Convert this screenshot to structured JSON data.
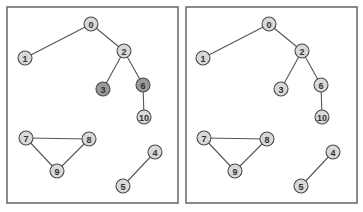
{
  "colors": {
    "background": "#ffffff",
    "panel_border": "#6e6e6e",
    "edge": "#555555",
    "node_fill_default": "#d9d9d9",
    "node_fill_highlight": "#9a9a9a",
    "node_stroke": "#4a4a4a",
    "label": "#333333"
  },
  "graph": {
    "node_radius": 7,
    "nodes": [
      {
        "id": "0",
        "label": "0",
        "x": 91,
        "y": 24
      },
      {
        "id": "1",
        "label": "1",
        "x": 25,
        "y": 58
      },
      {
        "id": "2",
        "label": "2",
        "x": 124,
        "y": 51
      },
      {
        "id": "3",
        "label": "3",
        "x": 103,
        "y": 89
      },
      {
        "id": "6",
        "label": "6",
        "x": 143,
        "y": 85
      },
      {
        "id": "10",
        "label": "10",
        "x": 144,
        "y": 117
      },
      {
        "id": "7",
        "label": "7",
        "x": 26,
        "y": 138
      },
      {
        "id": "8",
        "label": "8",
        "x": 89,
        "y": 139
      },
      {
        "id": "9",
        "label": "9",
        "x": 57,
        "y": 171
      },
      {
        "id": "4",
        "label": "4",
        "x": 155,
        "y": 152
      },
      {
        "id": "5",
        "label": "5",
        "x": 123,
        "y": 186
      }
    ],
    "edges": [
      [
        "0",
        "1"
      ],
      [
        "0",
        "2"
      ],
      [
        "2",
        "3"
      ],
      [
        "2",
        "6"
      ],
      [
        "6",
        "10"
      ],
      [
        "7",
        "8"
      ],
      [
        "7",
        "9"
      ],
      [
        "8",
        "9"
      ],
      [
        "4",
        "5"
      ]
    ]
  },
  "panels": [
    {
      "name": "left",
      "x": 7,
      "y": 7,
      "width": 171,
      "height": 196,
      "offset_x": 0,
      "highlighted": [
        "3",
        "6"
      ]
    },
    {
      "name": "right",
      "x": 186,
      "y": 7,
      "width": 171,
      "height": 196,
      "offset_x": 178,
      "highlighted": []
    }
  ]
}
